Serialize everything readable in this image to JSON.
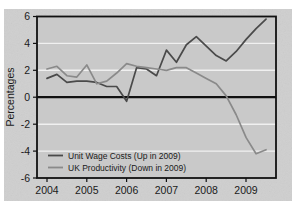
{
  "figure": {
    "background_color": "#cfcfcf",
    "page_color": "#ffffff",
    "plot_frame_color": "#111111",
    "gridline_color": "#f2f2f2",
    "zero_line_color": "#111111"
  },
  "axes": {
    "ylabel": "Percentages",
    "yticks": [
      "6",
      "4",
      "2",
      "0",
      "-2",
      "-4",
      "-6"
    ],
    "xticks": [
      "2004",
      "2005",
      "2006",
      "2007",
      "2008",
      "2009"
    ]
  },
  "legend": {
    "items": [
      {
        "label": "Unit Wage Costs (Up in 2009)",
        "color": "#4a4a4a"
      },
      {
        "label": "UK Productivity (Down in 2009)",
        "color": "#8a8a8a"
      }
    ]
  },
  "chart_data": {
    "type": "line",
    "title": "",
    "xlabel": "",
    "ylabel": "Percentages",
    "ylim": [
      -6,
      6
    ],
    "xlim": [
      2003.75,
      2009.75
    ],
    "grid": true,
    "legend_position": "bottom-left",
    "yticks": [
      6,
      4,
      2,
      0,
      -2,
      -4,
      -6
    ],
    "xticks": [
      2004,
      2005,
      2006,
      2007,
      2008,
      2009
    ],
    "x": [
      2004.0,
      2004.25,
      2004.5,
      2004.75,
      2005.0,
      2005.25,
      2005.5,
      2005.75,
      2006.0,
      2006.25,
      2006.5,
      2006.75,
      2007.0,
      2007.25,
      2007.5,
      2007.75,
      2008.0,
      2008.25,
      2008.5,
      2008.75,
      2009.0,
      2009.25,
      2009.5
    ],
    "series": [
      {
        "name": "Unit Wage Costs (Up in 2009)",
        "color": "#4a4a4a",
        "values": [
          1.4,
          1.7,
          1.1,
          1.2,
          1.2,
          1.1,
          0.8,
          0.8,
          -0.3,
          2.2,
          2.1,
          1.6,
          3.5,
          2.6,
          3.9,
          4.5,
          3.8,
          3.1,
          2.7,
          3.4,
          4.3,
          5.1,
          5.8
        ]
      },
      {
        "name": "UK Productivity (Down in 2009)",
        "color": "#8a8a8a",
        "values": [
          2.1,
          2.3,
          1.6,
          1.5,
          2.4,
          1.0,
          1.2,
          1.8,
          2.5,
          2.3,
          2.2,
          2.1,
          2.0,
          2.2,
          2.2,
          1.8,
          1.4,
          1.0,
          0.1,
          -1.3,
          -3.0,
          -4.2,
          -3.9
        ]
      }
    ]
  }
}
